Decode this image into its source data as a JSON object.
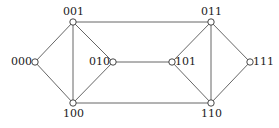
{
  "diagram": {
    "type": "graph",
    "nodes": [
      {
        "id": "000",
        "label": "000",
        "x": 35,
        "y": 62,
        "label_pos": "left"
      },
      {
        "id": "001",
        "label": "001",
        "x": 73,
        "y": 22,
        "label_pos": "top"
      },
      {
        "id": "010",
        "label": "010",
        "x": 113,
        "y": 62,
        "label_pos": "left"
      },
      {
        "id": "100",
        "label": "100",
        "x": 73,
        "y": 103,
        "label_pos": "bottom"
      },
      {
        "id": "011",
        "label": "011",
        "x": 211,
        "y": 22,
        "label_pos": "top"
      },
      {
        "id": "101",
        "label": "101",
        "x": 172,
        "y": 62,
        "label_pos": "right"
      },
      {
        "id": "111",
        "label": "111",
        "x": 250,
        "y": 62,
        "label_pos": "right"
      },
      {
        "id": "110",
        "label": "110",
        "x": 211,
        "y": 103,
        "label_pos": "bottom"
      }
    ],
    "edges": [
      [
        "000",
        "001"
      ],
      [
        "000",
        "100"
      ],
      [
        "001",
        "100"
      ],
      [
        "001",
        "010"
      ],
      [
        "010",
        "100"
      ],
      [
        "001",
        "011"
      ],
      [
        "010",
        "101"
      ],
      [
        "100",
        "110"
      ],
      [
        "011",
        "101"
      ],
      [
        "011",
        "110"
      ],
      [
        "011",
        "111"
      ],
      [
        "101",
        "110"
      ],
      [
        "111",
        "110"
      ]
    ],
    "colors": {
      "line": "#555555",
      "node_fill": "#ffffff",
      "node_stroke": "#333333"
    }
  }
}
